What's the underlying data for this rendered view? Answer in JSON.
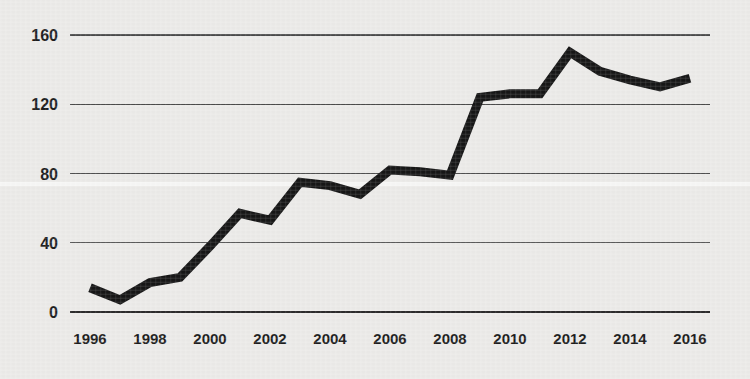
{
  "chart_data": {
    "type": "line",
    "title": "",
    "subtitle": "",
    "xlabel": "",
    "ylabel": "",
    "x": [
      1996,
      1997,
      1998,
      1999,
      2000,
      2001,
      2002,
      2003,
      2004,
      2005,
      2006,
      2007,
      2008,
      2009,
      2010,
      2011,
      2012,
      2013,
      2014,
      2015,
      2016
    ],
    "values": [
      14,
      7,
      17,
      20,
      38,
      57,
      53,
      75,
      73,
      68,
      82,
      81,
      79,
      124,
      126,
      126,
      150,
      139,
      134,
      130,
      135
    ],
    "series": [
      {
        "name": "series-1",
        "values": [
          14,
          7,
          17,
          20,
          38,
          57,
          53,
          75,
          73,
          68,
          82,
          81,
          79,
          124,
          126,
          126,
          150,
          139,
          134,
          130,
          135
        ],
        "color": "#161616"
      }
    ],
    "xlim": [
      1996,
      2016
    ],
    "ylim": [
      0,
      165
    ],
    "yticks": [
      0,
      40,
      80,
      120,
      160
    ],
    "ytick_labels": [
      "0",
      "40",
      "80",
      "120",
      "160"
    ],
    "xticks": [
      1996,
      1998,
      2000,
      2002,
      2004,
      2006,
      2008,
      2010,
      2012,
      2014,
      2016
    ],
    "xtick_labels": [
      "1996",
      "1998",
      "2000",
      "2002",
      "2004",
      "2006",
      "2008",
      "2010",
      "2012",
      "2014",
      "2016"
    ],
    "grid": true,
    "grid_axis": "y",
    "legend": false,
    "legend_position": "none",
    "annotations": [],
    "background_color": "#ebeae8",
    "line_color": "#161616",
    "grid_color": "#4a4a4a",
    "axis_color": "#2c2c2c",
    "text_color": "#1b1b1b"
  }
}
